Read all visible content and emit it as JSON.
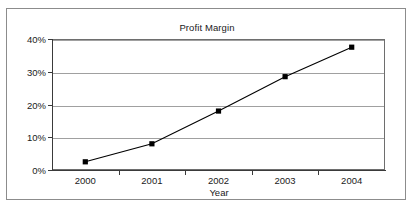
{
  "chart_data": {
    "type": "line",
    "title": "Profit Margin",
    "xlabel": "Year",
    "ylabel": "",
    "categories": [
      "2000",
      "2001",
      "2002",
      "2003",
      "2004"
    ],
    "values": [
      2.5,
      8,
      18,
      28.5,
      37.5
    ],
    "series": [
      {
        "name": "Profit Margin",
        "values": [
          2.5,
          8,
          18,
          28.5,
          37.5
        ]
      }
    ],
    "y_tick_labels": [
      "0%",
      "10%",
      "20%",
      "30%",
      "40%"
    ],
    "y_tick_values": [
      0,
      10,
      20,
      30,
      40
    ],
    "ylim": [
      0,
      40
    ],
    "value_suffix": "%",
    "grid": true,
    "grid_axis": "y",
    "legend": false,
    "legend_position": "none",
    "marker": "square",
    "marker_color": "#000000",
    "line_color": "#000000",
    "gridline_color": "#a0a0a0",
    "axis_color": "#3a3a3a",
    "plot_background": "#ffffff",
    "frame_border_color": "#8c8c8c"
  }
}
